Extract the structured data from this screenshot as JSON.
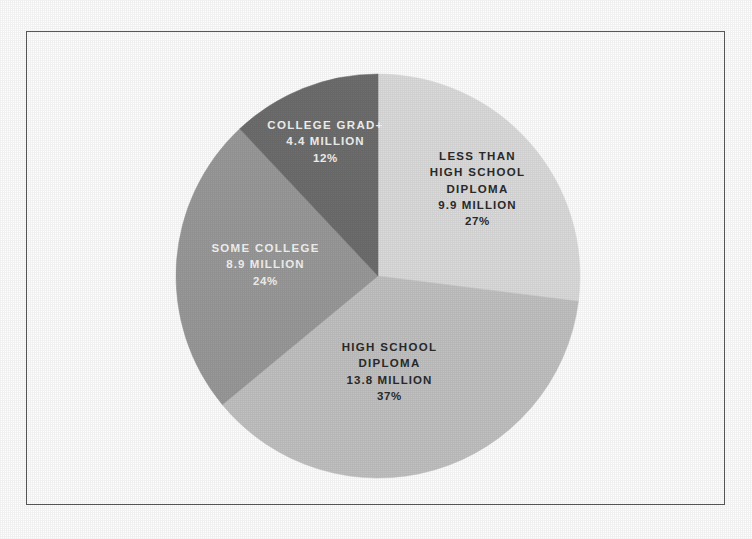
{
  "figure": {
    "border_color": "#5a5a5a",
    "background_color": "#ffffff"
  },
  "chart_data": {
    "type": "pie",
    "title": "",
    "subtitle": "",
    "xlabel": "",
    "ylabel": "",
    "legend_position": "none",
    "grid": false,
    "labels_inside_slices": true,
    "start_angle_deg": 0,
    "direction": "clockwise",
    "units": "millions of people",
    "categories": [
      "Less than high school diploma",
      "High school diploma",
      "Some college",
      "College grad+"
    ],
    "values": [
      9.9,
      13.8,
      8.9,
      4.4
    ],
    "percentages": [
      27,
      37,
      24,
      12
    ],
    "colors": [
      "#dcdcdc",
      "#c2c2c2",
      "#9a9a9a",
      "#6e6e6e"
    ],
    "slices": [
      {
        "name": "less-than-high-school-diploma",
        "label_lines": [
          "LESS THAN",
          "HIGH SCHOOL",
          "DIPLOMA"
        ],
        "value_text": "9.9 MILLION",
        "percent_text": "27%",
        "value": 9.9,
        "percent": 27,
        "color": "#dcdcdc",
        "text_color": "#2b2b2b"
      },
      {
        "name": "high-school-diploma",
        "label_lines": [
          "HIGH SCHOOL",
          "DIPLOMA"
        ],
        "value_text": "13.8 MILLION",
        "percent_text": "37%",
        "value": 13.8,
        "percent": 37,
        "color": "#c2c2c2",
        "text_color": "#2b2b2b"
      },
      {
        "name": "some-college",
        "label_lines": [
          "SOME COLLEGE"
        ],
        "value_text": "8.9 MILLION",
        "percent_text": "24%",
        "value": 8.9,
        "percent": 24,
        "color": "#9a9a9a",
        "text_color": "#f4f4f4"
      },
      {
        "name": "college-grad-plus",
        "label_lines": [
          "COLLEGE GRAD+"
        ],
        "value_text": "4.4 MILLION",
        "percent_text": "12%",
        "value": 4.4,
        "percent": 12,
        "color": "#6e6e6e",
        "text_color": "#f4f4f4"
      }
    ],
    "geometry": {
      "center_x": 378,
      "center_y": 276,
      "radius": 202
    }
  }
}
